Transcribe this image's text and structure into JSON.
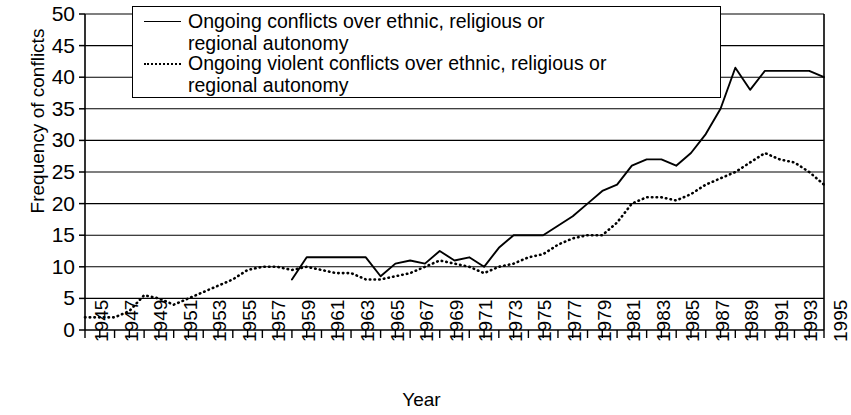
{
  "chart_data": {
    "type": "line",
    "title": "",
    "xlabel": "Year",
    "ylabel": "Frequency of conflicts",
    "ylim": [
      0,
      50
    ],
    "ytick_labels": [
      "50",
      "45",
      "40",
      "35",
      "30",
      "25",
      "20",
      "15",
      "10",
      "5",
      "0"
    ],
    "ytick_values": [
      50,
      45,
      40,
      35,
      30,
      25,
      20,
      15,
      10,
      5,
      0
    ],
    "grid": true,
    "legend_position": "top-center",
    "xlim": [
      1945,
      1995
    ],
    "x": [
      1945,
      1946,
      1947,
      1948,
      1949,
      1950,
      1951,
      1952,
      1953,
      1954,
      1955,
      1956,
      1957,
      1958,
      1959,
      1960,
      1961,
      1962,
      1963,
      1964,
      1965,
      1966,
      1967,
      1968,
      1969,
      1970,
      1971,
      1972,
      1973,
      1974,
      1975,
      1976,
      1977,
      1978,
      1979,
      1980,
      1981,
      1982,
      1983,
      1984,
      1985,
      1986,
      1987,
      1988,
      1989,
      1990,
      1991,
      1992,
      1993,
      1994,
      1995
    ],
    "xtick_labels": [
      "1945",
      "1947",
      "1949",
      "1951",
      "1953",
      "1955",
      "1957",
      "1959",
      "1961",
      "1963",
      "1965",
      "1967",
      "1969",
      "1971",
      "1973",
      "1975",
      "1977",
      "1979",
      "1981",
      "1983",
      "1985",
      "1987",
      "1989",
      "1991",
      "1993",
      "1995"
    ],
    "xtick_values": [
      1945,
      1947,
      1949,
      1951,
      1953,
      1955,
      1957,
      1959,
      1961,
      1963,
      1965,
      1967,
      1969,
      1971,
      1973,
      1975,
      1977,
      1979,
      1981,
      1983,
      1985,
      1987,
      1989,
      1991,
      1993,
      1995
    ],
    "series": [
      {
        "name": "Ongoing conflicts over ethnic, religious or regional autonomy",
        "style": "solid",
        "x_start": 1959,
        "values": [
          null,
          null,
          null,
          null,
          null,
          null,
          null,
          null,
          null,
          null,
          null,
          null,
          null,
          null,
          8,
          11.5,
          11.5,
          11.5,
          11.5,
          11.5,
          8.5,
          10.5,
          11,
          10.5,
          12.5,
          11,
          11.5,
          10,
          13,
          15,
          15,
          15,
          16.5,
          18,
          20,
          22,
          23,
          26,
          27,
          27,
          26,
          28,
          31,
          35,
          41.5,
          38,
          41,
          41,
          41,
          41,
          40
        ]
      },
      {
        "name": "Ongoing violent conflicts over ethnic, religious or regional autonomy",
        "style": "dotted",
        "x_start": 1945,
        "values": [
          2,
          2,
          2,
          3,
          5.5,
          5,
          4,
          5,
          6,
          7,
          8,
          9.5,
          10,
          10,
          9.5,
          10,
          9.5,
          9,
          9,
          8,
          8,
          8.5,
          9,
          10,
          11,
          10.5,
          10,
          9,
          10,
          10.5,
          11.5,
          12,
          13.5,
          14.5,
          15,
          15,
          17,
          20,
          21,
          21,
          20.5,
          21.5,
          23,
          24,
          25,
          26.5,
          28,
          27,
          26.5,
          25,
          23
        ]
      }
    ]
  },
  "legend": {
    "entries": [
      {
        "style": "solid-line",
        "line1": "Ongoing conflicts over ethnic, religious or",
        "line2": "regional autonomy"
      },
      {
        "style": "dotted-line",
        "line1": "Ongoing violent conflicts over ethnic, religious or",
        "line2": "regional autonomy"
      }
    ]
  },
  "axes": {
    "y_title": "Frequency of conflicts",
    "x_title": "Year"
  },
  "colors": {
    "line": "#000000",
    "grid": "#000000",
    "background": "#ffffff"
  }
}
